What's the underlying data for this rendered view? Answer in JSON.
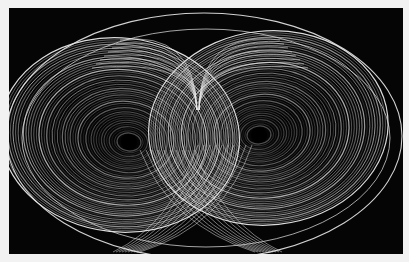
{
  "image": {
    "subject": "Lorenz attractor (butterfly) rendered as white trajectories on black",
    "background": "#f2f2f2",
    "panel_color": "#050505",
    "stroke_color": "#e8e8e8",
    "panel": {
      "x": 9,
      "y": 8,
      "w": 394,
      "h": 246
    },
    "lobes": [
      {
        "name": "left",
        "cx": 129,
        "cy": 142
      },
      {
        "name": "right",
        "cx": 259,
        "cy": 135
      }
    ],
    "outer_orbit": {
      "cx": 204,
      "cy": 136,
      "rx": 198,
      "ry": 123
    }
  }
}
